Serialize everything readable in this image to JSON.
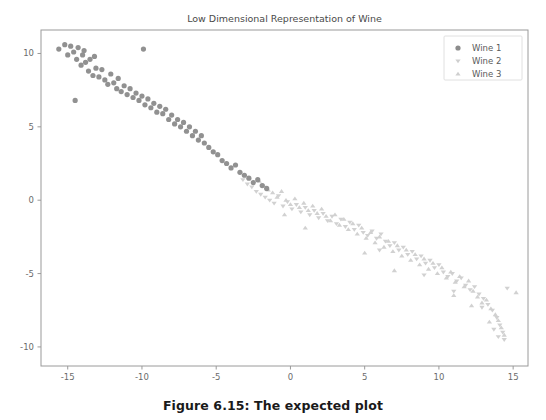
{
  "figure": {
    "caption": "Figure 6.15: The expected plot",
    "background": "#ffffff"
  },
  "chart_data": {
    "type": "scatter",
    "title": "Low Dimensional Representation of Wine",
    "xlabel": "",
    "ylabel": "",
    "xlim": [
      -16.8,
      16.0
    ],
    "ylim": [
      -11.3,
      11.6
    ],
    "xticks": [
      -15,
      -10,
      -5,
      0,
      5,
      10,
      15
    ],
    "yticks": [
      10,
      5,
      0,
      -5,
      -10
    ],
    "grid": false,
    "legend_position": "upper right",
    "axes_frame_color": "#9a9a9a",
    "tick_label_color": "#6b6b6b",
    "title_color": "#4a4a4a",
    "series": [
      {
        "name": "Wine 1",
        "marker": "circle",
        "color": "#8c8c8c",
        "size": 4.4,
        "points": [
          [
            -15.6,
            10.3
          ],
          [
            -15.2,
            10.6
          ],
          [
            -15.0,
            9.9
          ],
          [
            -14.8,
            10.5
          ],
          [
            -14.6,
            10.1
          ],
          [
            -14.4,
            9.6
          ],
          [
            -14.3,
            10.4
          ],
          [
            -14.1,
            9.2
          ],
          [
            -14.0,
            9.9
          ],
          [
            -13.8,
            9.4
          ],
          [
            -13.6,
            8.8
          ],
          [
            -14.5,
            6.8
          ],
          [
            -13.5,
            9.6
          ],
          [
            -13.3,
            8.5
          ],
          [
            -13.1,
            9.0
          ],
          [
            -12.9,
            8.4
          ],
          [
            -12.7,
            8.9
          ],
          [
            -12.5,
            8.2
          ],
          [
            -12.3,
            7.9
          ],
          [
            -12.1,
            8.6
          ],
          [
            -11.9,
            8.0
          ],
          [
            -11.7,
            7.6
          ],
          [
            -11.6,
            8.3
          ],
          [
            -11.4,
            7.4
          ],
          [
            -11.2,
            7.8
          ],
          [
            -11.0,
            7.2
          ],
          [
            -10.8,
            7.6
          ],
          [
            -10.6,
            7.0
          ],
          [
            -9.9,
            10.3
          ],
          [
            -10.4,
            7.3
          ],
          [
            -10.2,
            6.8
          ],
          [
            -10.0,
            7.1
          ],
          [
            -9.8,
            6.5
          ],
          [
            -9.6,
            6.9
          ],
          [
            -9.4,
            6.3
          ],
          [
            -9.2,
            6.6
          ],
          [
            -9.0,
            6.0
          ],
          [
            -8.8,
            6.4
          ],
          [
            -8.6,
            5.9
          ],
          [
            -8.4,
            6.2
          ],
          [
            -8.2,
            5.5
          ],
          [
            -8.0,
            5.8
          ],
          [
            -7.8,
            5.2
          ],
          [
            -7.6,
            5.5
          ],
          [
            -7.4,
            5.0
          ],
          [
            -7.2,
            5.3
          ],
          [
            -7.0,
            4.7
          ],
          [
            -6.8,
            5.0
          ],
          [
            -6.6,
            4.4
          ],
          [
            -6.4,
            4.7
          ],
          [
            -6.2,
            4.1
          ],
          [
            -6.0,
            4.4
          ],
          [
            -5.8,
            3.9
          ],
          [
            -5.5,
            3.6
          ],
          [
            -5.2,
            3.3
          ],
          [
            -4.9,
            3.1
          ],
          [
            -4.6,
            2.7
          ],
          [
            -4.3,
            2.5
          ],
          [
            -4.0,
            2.2
          ],
          [
            -3.7,
            2.4
          ],
          [
            -3.4,
            1.9
          ],
          [
            -3.1,
            1.7
          ],
          [
            -2.8,
            1.5
          ],
          [
            -2.5,
            1.2
          ],
          [
            -2.2,
            1.4
          ],
          [
            -1.9,
            1.0
          ],
          [
            -1.6,
            0.8
          ],
          [
            -13.9,
            10.2
          ],
          [
            -13.2,
            9.8
          ]
        ]
      },
      {
        "name": "Wine 2",
        "marker": "triangle-down",
        "color": "#cfcfcf",
        "size": 4.4,
        "points": [
          [
            -3.2,
            1.4
          ],
          [
            -2.9,
            1.1
          ],
          [
            -2.6,
            0.9
          ],
          [
            -2.3,
            0.6
          ],
          [
            -2.0,
            0.4
          ],
          [
            -1.7,
            0.2
          ],
          [
            -1.4,
            0.0
          ],
          [
            -1.1,
            -0.2
          ],
          [
            -0.8,
            0.3
          ],
          [
            -0.5,
            -0.4
          ],
          [
            -0.2,
            -0.1
          ],
          [
            0.1,
            -0.6
          ],
          [
            0.4,
            -0.3
          ],
          [
            0.7,
            -0.8
          ],
          [
            1.0,
            -0.5
          ],
          [
            1.3,
            -1.0
          ],
          [
            1.6,
            -0.7
          ],
          [
            1.9,
            -1.2
          ],
          [
            2.2,
            -0.9
          ],
          [
            2.5,
            -1.4
          ],
          [
            2.8,
            -1.1
          ],
          [
            3.1,
            -1.6
          ],
          [
            3.4,
            -1.3
          ],
          [
            3.7,
            -1.8
          ],
          [
            4.0,
            -1.5
          ],
          [
            4.3,
            -2.0
          ],
          [
            4.6,
            -1.7
          ],
          [
            4.9,
            -2.2
          ],
          [
            5.2,
            -2.4
          ],
          [
            5.5,
            -2.1
          ],
          [
            5.8,
            -2.6
          ],
          [
            6.1,
            -2.3
          ],
          [
            6.4,
            -2.8
          ],
          [
            6.7,
            -3.1
          ],
          [
            7.0,
            -2.9
          ],
          [
            7.3,
            -3.4
          ],
          [
            7.6,
            -3.2
          ],
          [
            7.9,
            -3.7
          ],
          [
            8.2,
            -3.5
          ],
          [
            8.5,
            -4.0
          ],
          [
            8.8,
            -3.8
          ],
          [
            9.1,
            -4.3
          ],
          [
            9.4,
            -4.1
          ],
          [
            9.7,
            -4.6
          ],
          [
            10.0,
            -4.4
          ],
          [
            10.3,
            -4.9
          ],
          [
            10.6,
            -5.2
          ],
          [
            10.9,
            -5.0
          ],
          [
            11.2,
            -5.5
          ],
          [
            11.5,
            -5.3
          ],
          [
            11.8,
            -5.8
          ],
          [
            12.1,
            -6.1
          ],
          [
            12.4,
            -5.9
          ],
          [
            12.7,
            -6.4
          ],
          [
            13.0,
            -6.7
          ],
          [
            13.3,
            -7.1
          ],
          [
            13.6,
            -7.5
          ],
          [
            13.9,
            -8.0
          ],
          [
            14.1,
            -8.5
          ],
          [
            14.3,
            -9.0
          ],
          [
            14.4,
            -9.5
          ],
          [
            14.0,
            -9.3
          ],
          [
            13.7,
            -8.8
          ],
          [
            14.6,
            -6.0
          ],
          [
            12.9,
            -7.3
          ],
          [
            11.0,
            -6.2
          ],
          [
            9.0,
            -5.1
          ],
          [
            6.0,
            -3.4
          ]
        ]
      },
      {
        "name": "Wine 3",
        "marker": "triangle-up",
        "color": "#cfcfcf",
        "size": 4.4,
        "points": [
          [
            -2.1,
            1.3
          ],
          [
            -1.8,
            1.0
          ],
          [
            -1.5,
            0.7
          ],
          [
            -1.2,
            0.5
          ],
          [
            -0.9,
            0.2
          ],
          [
            -0.6,
            0.6
          ],
          [
            -0.3,
            0.0
          ],
          [
            0.0,
            -0.3
          ],
          [
            0.3,
            0.1
          ],
          [
            0.6,
            -0.5
          ],
          [
            0.9,
            -0.2
          ],
          [
            1.2,
            -0.7
          ],
          [
            1.5,
            -0.4
          ],
          [
            1.8,
            -0.9
          ],
          [
            2.1,
            -0.6
          ],
          [
            2.4,
            -1.1
          ],
          [
            2.7,
            -1.4
          ],
          [
            3.0,
            -1.0
          ],
          [
            3.3,
            -1.7
          ],
          [
            3.6,
            -1.3
          ],
          [
            3.9,
            -2.0
          ],
          [
            4.2,
            -1.6
          ],
          [
            4.5,
            -2.3
          ],
          [
            4.8,
            -1.9
          ],
          [
            5.1,
            -2.6
          ],
          [
            5.4,
            -2.2
          ],
          [
            5.7,
            -2.9
          ],
          [
            6.0,
            -2.5
          ],
          [
            6.3,
            -3.2
          ],
          [
            6.6,
            -2.8
          ],
          [
            6.9,
            -3.5
          ],
          [
            7.2,
            -3.1
          ],
          [
            7.5,
            -3.8
          ],
          [
            7.8,
            -3.4
          ],
          [
            8.1,
            -4.1
          ],
          [
            8.4,
            -3.7
          ],
          [
            8.7,
            -4.4
          ],
          [
            9.0,
            -4.0
          ],
          [
            9.3,
            -4.7
          ],
          [
            9.6,
            -4.3
          ],
          [
            9.9,
            -5.0
          ],
          [
            10.2,
            -4.6
          ],
          [
            10.5,
            -5.3
          ],
          [
            10.8,
            -4.9
          ],
          [
            11.1,
            -5.6
          ],
          [
            11.4,
            -5.2
          ],
          [
            11.7,
            -5.9
          ],
          [
            12.0,
            -5.5
          ],
          [
            12.3,
            -6.2
          ],
          [
            12.6,
            -6.6
          ],
          [
            12.9,
            -7.0
          ],
          [
            13.2,
            -6.8
          ],
          [
            13.5,
            -7.4
          ],
          [
            13.8,
            -7.8
          ],
          [
            14.0,
            -8.2
          ],
          [
            14.2,
            -8.7
          ],
          [
            14.4,
            -9.2
          ],
          [
            13.4,
            -8.3
          ],
          [
            12.2,
            -7.2
          ],
          [
            11.0,
            -6.5
          ],
          [
            7.0,
            -4.8
          ],
          [
            5.0,
            -3.6
          ],
          [
            1.0,
            -1.9
          ],
          [
            -0.4,
            -1.0
          ],
          [
            15.2,
            -6.3
          ]
        ]
      }
    ]
  },
  "legend": {
    "entries": [
      {
        "label": "Wine 1",
        "marker": "circle",
        "color": "#8c8c8c"
      },
      {
        "label": "Wine 2",
        "marker": "triangle-down",
        "color": "#cfcfcf"
      },
      {
        "label": "Wine 3",
        "marker": "triangle-up",
        "color": "#cfcfcf"
      }
    ]
  }
}
